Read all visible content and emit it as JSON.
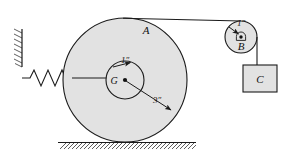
{
  "figure": {
    "colors": {
      "body_fill": "#e2e2e2",
      "stroke": "#1a1a1a",
      "background": "#ffffff"
    },
    "labels": {
      "disk": "A",
      "center": "G",
      "hub_radius": "1″",
      "disk_radius": "3″",
      "pulley": "B",
      "pulley_radius": "1″",
      "block": "C"
    },
    "geometry": {
      "disk": {
        "cx": 125,
        "cy": 80,
        "r_outer": 62,
        "r_hub": 19
      },
      "pulley": {
        "cx": 241,
        "cy": 37,
        "r": 16,
        "r_pivot": 3.4
      },
      "block": {
        "x": 243,
        "y": 65,
        "w": 34,
        "h": 27
      },
      "ground": {
        "y": 142,
        "x1": 58,
        "x2": 196
      },
      "wall": {
        "x": 22,
        "y1": 30,
        "y2": 66
      },
      "spring": {
        "x1": 28,
        "x2": 72,
        "y": 78,
        "coils": 4,
        "amp": 9
      },
      "cord_top": {
        "x1": 125,
        "y1": 18,
        "x2": 241,
        "y2": 21
      },
      "cord_block": {
        "x": 257,
        "y1": 37,
        "y2": 65
      },
      "hub_cord": {
        "x1": 72,
        "y1": 78,
        "x2": 130,
        "y2": 78
      }
    },
    "dimensions": {
      "hub_arrow": {
        "from_x": 113,
        "from_y": 66,
        "to_x": 131,
        "to_y": 62
      },
      "disk_arrow": {
        "from_x": 125,
        "from_y": 80,
        "to_x": 173,
        "to_y": 111
      }
    }
  }
}
